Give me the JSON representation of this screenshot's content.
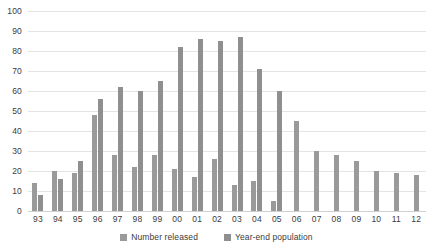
{
  "chart_data": {
    "type": "bar",
    "title": "",
    "xlabel": "",
    "ylabel": "",
    "ylim": [
      0,
      100
    ],
    "ytick_step": 10,
    "yticks": [
      100,
      90,
      80,
      70,
      60,
      50,
      40,
      30,
      20,
      10,
      0
    ],
    "grid": true,
    "legend_position": "bottom",
    "categories": [
      "93",
      "94",
      "95",
      "96",
      "97",
      "98",
      "99",
      "00",
      "01",
      "02",
      "03",
      "04",
      "05",
      "06",
      "07",
      "08",
      "09",
      "10",
      "11",
      "12"
    ],
    "series": [
      {
        "name": "Number released",
        "color": "#9a9a9a",
        "values": [
          14,
          20,
          19,
          48,
          28,
          22,
          28,
          21,
          17,
          26,
          13,
          15,
          5,
          45,
          30,
          28,
          25,
          20,
          19,
          18
        ]
      },
      {
        "name": "Year-end population",
        "color": "#8f8f8f",
        "values": [
          8,
          16,
          25,
          56,
          62,
          60,
          65,
          82,
          86,
          85,
          87,
          71,
          60,
          null,
          null,
          null,
          null,
          null,
          null,
          null
        ]
      }
    ]
  },
  "legend": {
    "items": [
      {
        "label": "Number released"
      },
      {
        "label": "Year-end population"
      }
    ]
  }
}
